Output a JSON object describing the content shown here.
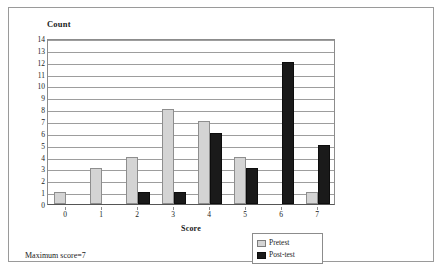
{
  "figure": {
    "caption": "Maximum score=7"
  },
  "chart_data": {
    "type": "bar",
    "title": "",
    "xlabel": "Score",
    "ylabel": "Count",
    "categories": [
      "0",
      "1",
      "2",
      "3",
      "4",
      "5",
      "6",
      "7"
    ],
    "series": [
      {
        "name": "Pretest",
        "values": [
          1,
          3,
          4,
          8,
          7,
          4,
          0,
          1
        ]
      },
      {
        "name": "Post-test",
        "values": [
          0,
          0,
          1,
          1,
          6,
          3,
          12,
          5
        ]
      }
    ],
    "ylim": [
      0,
      14
    ],
    "yticks": [
      0,
      1,
      2,
      3,
      4,
      5,
      6,
      7,
      8,
      9,
      10,
      11,
      12,
      13,
      14
    ],
    "grid": true,
    "legend_position": "bottom-right",
    "colors": {
      "pretest": "#d4d4d4",
      "posttest": "#1a1a1a",
      "grid": "#9d9d9d",
      "axis": "#8c8c8c",
      "frame": "#9a9a9a"
    }
  }
}
